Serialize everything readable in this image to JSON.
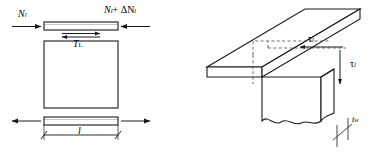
{
  "figure": {
    "stroke_color": "#1a1a1a",
    "fill_color": "#ffffff",
    "dash_color": "#4d4d4d",
    "left_panel": {
      "name": "free-body-diagram-of-flange-element",
      "labels": {
        "force_left": "N",
        "force_left_sub": "l",
        "force_right_prefix": "N",
        "force_right_sub1": "l",
        "force_right_mid": "+ ΔN",
        "force_right_sub2": "l",
        "shear_force": "T",
        "shear_force_sub": "L",
        "length_dim": "l"
      }
    },
    "right_panel": {
      "name": "three-dimensional-flange-web-junction",
      "labels": {
        "shear_stress_top": "τ",
        "shear_stress_top_sub": "l",
        "shear_stress_side": "τ",
        "shear_stress_side_sub": "l",
        "web_thickness": "t",
        "web_thickness_sub": "w"
      }
    }
  }
}
